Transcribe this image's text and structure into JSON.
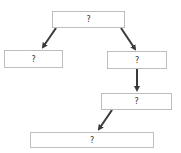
{
  "diagram": {
    "type": "tree-flowchart",
    "nodes": [
      {
        "id": "root",
        "label": "?",
        "x": 52,
        "y": 11,
        "w": 73,
        "h": 17
      },
      {
        "id": "left",
        "label": "?",
        "x": 4,
        "y": 50,
        "w": 59,
        "h": 18
      },
      {
        "id": "right",
        "label": "?",
        "x": 107,
        "y": 51,
        "w": 60,
        "h": 18
      },
      {
        "id": "right-child",
        "label": "?",
        "x": 101,
        "y": 93,
        "w": 71,
        "h": 17
      },
      {
        "id": "bottom",
        "label": "?",
        "x": 30,
        "y": 132,
        "w": 124,
        "h": 16
      }
    ],
    "edges": [
      {
        "from": "root",
        "to": "left"
      },
      {
        "from": "root",
        "to": "right"
      },
      {
        "from": "right",
        "to": "right-child"
      },
      {
        "from": "right-child",
        "to": "bottom"
      }
    ],
    "colors": {
      "border": "#bdbdbd",
      "arrow": "#3a3a3a",
      "text": "#333333"
    }
  }
}
